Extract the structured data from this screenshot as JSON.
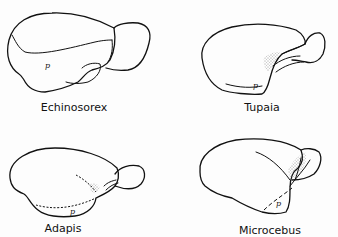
{
  "figure": {
    "panels": [
      {
        "id": "echinosorex",
        "label": "Echinosorex",
        "marker": "p"
      },
      {
        "id": "tupaia",
        "label": "Tupaia",
        "marker": "p"
      },
      {
        "id": "adapis",
        "label": "Adapis",
        "marker": "p"
      },
      {
        "id": "microcebus",
        "label": "Microcebus",
        "marker": "p"
      }
    ]
  }
}
